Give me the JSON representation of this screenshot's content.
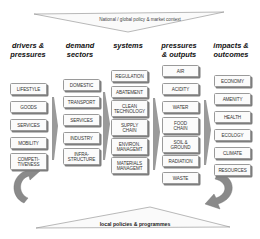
{
  "top_banner": {
    "label": "National / global policy & market context"
  },
  "bottom_banner": {
    "label": "local policies & programmes"
  },
  "columns": [
    {
      "heading": "drivers & pressures",
      "heading_l1": "drivers &",
      "heading_l2": "pressures",
      "items": [
        "LIFESTYLE",
        "GOODS",
        "SERVICES",
        "MOBILITY",
        "COMPETI-\nTIVENESS"
      ]
    },
    {
      "heading": "demand sectors",
      "heading_l1": "demand",
      "heading_l2": "sectors",
      "items": [
        "DOMESTIC",
        "TRANSPORT",
        "SERVICES",
        "INDUSTRY",
        "INFRA-\nSTRUCTURE"
      ]
    },
    {
      "heading": "systems",
      "heading_l1": "systems",
      "heading_l2": "",
      "items": [
        "REGULATION",
        "ABATEMENT",
        "CLEAN\nTECHNOLOGY",
        "SUPPLY\nCHAIN",
        "ENVIRON.\nMANAGEMT",
        "MATERIALS\nMANAGEMT"
      ]
    },
    {
      "heading": "pressures & outputs",
      "heading_l1": "pressures",
      "heading_l2": "& outputs",
      "items": [
        "AIR",
        "ACIDITY",
        "WATER",
        "FOOD\nCHAIN",
        "SOIL &\nGROUND",
        "RADIATION",
        "WASTE"
      ]
    },
    {
      "heading": "impacts & outcomes",
      "heading_l1": "impacts &",
      "heading_l2": "outcomes",
      "items": [
        "ECONOMY",
        "AMENITY",
        "HEALTH",
        "ECOLOGY",
        "CLIMATE",
        "RESOURCES"
      ]
    }
  ],
  "colors": {
    "box_border": "#9a9a9a",
    "box_shadow": "#7d7d7d",
    "arrow_gray": "#8a8a8a",
    "banner_line": "#888888"
  }
}
